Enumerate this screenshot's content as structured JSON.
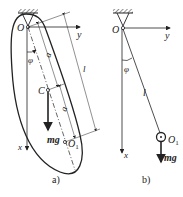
{
  "figure_a": {
    "caption": "a)",
    "labels": {
      "pivot": "O",
      "y_axis": "y",
      "x_axis": "x",
      "angle": "φ",
      "center_of_mass": "C",
      "weight": "mg",
      "point_o1": "O",
      "point_o1_sub": "1",
      "dim_a_upper": "a",
      "dim_a_lower": "a",
      "dim_l": "l"
    }
  },
  "figure_b": {
    "caption": "b)",
    "labels": {
      "pivot": "O",
      "y_axis": "y",
      "x_axis": "x",
      "angle": "φ",
      "length": "l",
      "bob": "O",
      "bob_sub": "1",
      "weight": "mg"
    }
  },
  "colors": {
    "stroke": "#222222",
    "background": "#ffffff"
  }
}
